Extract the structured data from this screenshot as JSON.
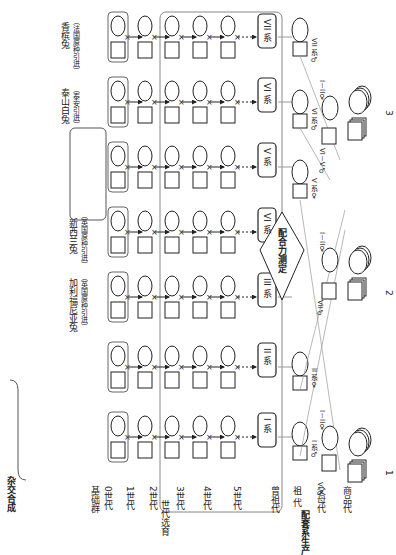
{
  "diagram": {
    "title_rotation": "90deg clockwise",
    "stages": {
      "hybrid_synthesis": {
        "label": "杂交合成",
        "chars": [
          "杂",
          "交",
          "合",
          "成"
        ]
      },
      "base_group": "基础群",
      "gen0": "0世代",
      "selective_breeding": {
        "label": "世代选育",
        "chars": [
          "世",
          "代",
          "选",
          "育"
        ]
      },
      "generations": [
        "1世代",
        "2世代",
        "3世代",
        "4世代",
        "5世代"
      ],
      "production": {
        "label": "配套系生产",
        "chars": [
          "配",
          "套",
          "系",
          "生",
          "产"
        ]
      },
      "production_gens": [
        "曾祖代",
        "祖 代",
        "父母代",
        "商品代"
      ]
    },
    "sources": {
      "line1_crosses": [
        {
          "female": "GD14",
          "male": "GD04"
        },
        {
          "female": "GD14",
          "male": "PS18"
        },
        {
          "female": "GD14",
          "male": "BC16"
        },
        {
          "female": "GD14",
          "male": "BC16"
        }
      ],
      "line2_crosses": [
        {
          "female": "GD14",
          "male": "GD04"
        },
        {
          "female": "PS18",
          "male": "GD04"
        },
        {
          "female": "GD02",
          "male": "GD04"
        },
        {
          "female": "BC23",
          "male": "BC23"
        }
      ],
      "line3": {
        "name": "加利福尼亚兔",
        "origin": "（英国原种引进）"
      },
      "line4": {
        "name": "新西兰兔",
        "origin": "（英国原种引进）"
      },
      "line5_crosses": {
        "top": {
          "female": "GD04",
          "male": "GD04"
        },
        "mid_female": "PS18",
        "mid_male": "PS18",
        "bottom_male": "GD04",
        "group": [
          {
            "male": "BC34",
            "female": "BC34"
          },
          {
            "male": "BC38",
            "female": "BC38"
          },
          {
            "male": "BC01",
            "female": "BC01"
          }
        ]
      },
      "line6": {
        "name": "泰山白兔",
        "origin": "（泰安引进）"
      },
      "line7": {
        "name": "香槟兔",
        "origin": "（法国原种引进）"
      }
    },
    "lines": [
      "I 系",
      "II 系",
      "III 系",
      "VI 系",
      "V 系",
      "VI 系",
      "VII 系"
    ],
    "combining_ability": "配合力测定",
    "symbols": {
      "cross": "×",
      "arrow": "→"
    },
    "schemes": [
      {
        "number": "1",
        "grand_male": "I 系♂",
        "grand_female": "II 系♀",
        "parent_female": "I－II♀",
        "parent_male": "VI♂"
      },
      {
        "number": "2",
        "parent_female": "I－II♀",
        "parent_male": "VII♂"
      },
      {
        "number": "3",
        "grand_male_vi": "VI 系♂",
        "grand_male_vii": "VII 系♂",
        "grand_female_v": "V 系♀",
        "parent_female": "I－II♀",
        "parent_male": "VI－V♂"
      }
    ]
  }
}
